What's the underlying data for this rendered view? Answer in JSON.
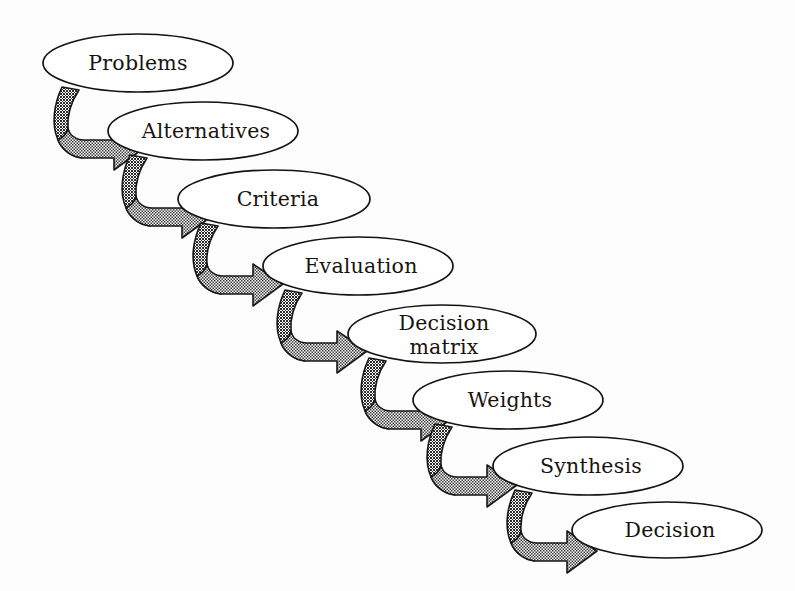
{
  "diagram": {
    "type": "sequential-flow-chain",
    "background_color": "#fdfdfd",
    "node_fill_color": "#ffffff",
    "node_stroke_color": "#15120f",
    "arrow_fill_color": "#8f8f8f",
    "arrow_stroke_color": "#1a1714",
    "text_color": "#17130f",
    "step_count": 8,
    "arrow_count": 7,
    "nodes": [
      {
        "id": "problems",
        "label": "Problems",
        "lines": [
          "Problems"
        ],
        "order": 1,
        "cx": 138,
        "cy": 63,
        "rx": 95,
        "ry": 29
      },
      {
        "id": "alternatives",
        "label": "Alternatives",
        "lines": [
          "Alternatives"
        ],
        "order": 2,
        "cx": 203,
        "cy": 131,
        "rx": 95,
        "ry": 29
      },
      {
        "id": "criteria",
        "label": "Criteria",
        "lines": [
          "Criteria"
        ],
        "order": 3,
        "cx": 274,
        "cy": 199,
        "rx": 96,
        "ry": 29
      },
      {
        "id": "evaluation",
        "label": "Evaluation",
        "lines": [
          "Evaluation"
        ],
        "order": 4,
        "cx": 358,
        "cy": 266,
        "rx": 95,
        "ry": 29
      },
      {
        "id": "decision-matrix",
        "label": "Decision matrix",
        "lines": [
          "Decision",
          "matrix"
        ],
        "order": 5,
        "cx": 442,
        "cy": 334,
        "rx": 94,
        "ry": 29
      },
      {
        "id": "weights",
        "label": "Weights",
        "lines": [
          "Weights"
        ],
        "order": 6,
        "cx": 508,
        "cy": 400,
        "rx": 95,
        "ry": 29
      },
      {
        "id": "synthesis",
        "label": "Synthesis",
        "lines": [
          "Synthesis"
        ],
        "order": 7,
        "cx": 588,
        "cy": 466,
        "rx": 95,
        "ry": 29
      },
      {
        "id": "decision",
        "label": "Decision",
        "lines": [
          "Decision"
        ],
        "order": 8,
        "cx": 667,
        "cy": 530,
        "rx": 95,
        "ry": 28
      }
    ],
    "connectors": [
      {
        "id": "arrow-problems-to-alternatives",
        "from": "problems",
        "to": "alternatives",
        "ox": 0,
        "oy": 0
      },
      {
        "id": "arrow-alternatives-to-criteria",
        "from": "alternatives",
        "to": "criteria",
        "ox": 68,
        "oy": 68
      },
      {
        "id": "arrow-criteria-to-evaluation",
        "from": "criteria",
        "to": "evaluation",
        "ox": 139,
        "oy": 136
      },
      {
        "id": "arrow-evaluation-to-decision-matrix",
        "from": "evaluation",
        "to": "decision-matrix",
        "ox": 223,
        "oy": 203
      },
      {
        "id": "arrow-decision-matrix-to-weights",
        "from": "decision-matrix",
        "to": "weights",
        "ox": 307,
        "oy": 271
      },
      {
        "id": "arrow-weights-to-synthesis",
        "from": "weights",
        "to": "synthesis",
        "ox": 373,
        "oy": 337
      },
      {
        "id": "arrow-synthesis-to-decision",
        "from": "synthesis",
        "to": "decision",
        "ox": 453,
        "oy": 403
      }
    ]
  }
}
